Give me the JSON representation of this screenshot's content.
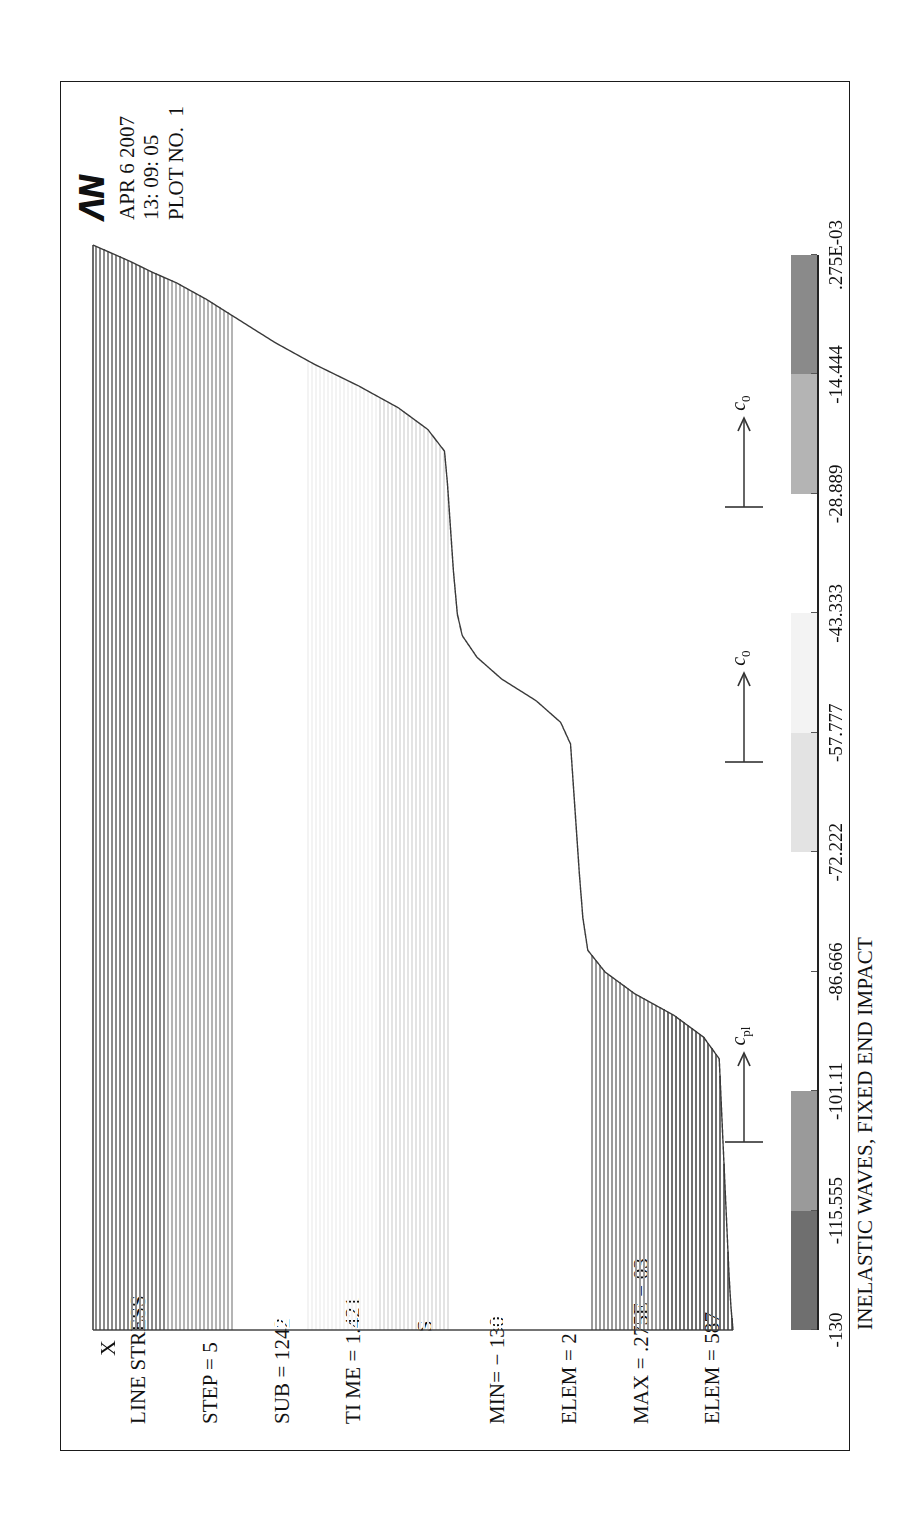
{
  "window": {
    "background": "#ffffff",
    "frame_color": "#1a1a1a"
  },
  "header": {
    "logo_text": "ΛΝ",
    "logo_name": "ansys-logo",
    "date": "APR 6 2007",
    "time": "13: 09: 05",
    "plot_no": "PLOT NO.  1"
  },
  "info": {
    "line1": "LINE STRESS",
    "line2": "STEP = 5",
    "line3": "SUB = 1242",
    "line4": "TI ME = 1.421",
    "line5": "S",
    "line6": "MIN= − 130",
    "line7": "ELEM = 2",
    "line8": "MAX = .275E − 03",
    "line9": "ELEM = 587"
  },
  "plot": {
    "x_axis_label": "X",
    "title": "INELASTIC WAVES, FIXED END IMPACT",
    "annotations": [
      {
        "name": "c-pl-arrow",
        "label": "c",
        "subscript": "pl"
      },
      {
        "name": "c-0-arrow-left",
        "label": "c",
        "subscript": "0"
      },
      {
        "name": "c-0-arrow-right",
        "label": "c",
        "subscript": "0"
      }
    ]
  },
  "colorbar": {
    "name": "stress-colorbar",
    "orientation": "horizontal",
    "labels": [
      "-130",
      "-115.555",
      "-101.11",
      "-86.666",
      "-72.222",
      "-57.777",
      "-43.333",
      "-28.889",
      "-14.444",
      ".275E-03"
    ],
    "band_colors": [
      "#6f6f6f",
      "#9a9a9a",
      "#ffffff",
      "#ffffff",
      "#e3e3e3",
      "#f3f3f3",
      "#ffffff",
      "#b4b4b4",
      "#8a8a8a"
    ]
  },
  "chart_data": {
    "type": "area",
    "title": "INELASTIC WAVES, FIXED END IMPACT",
    "subtitle": "LINE STRESS",
    "xlabel": "X",
    "ylabel": "S (stress)",
    "ylim": [
      -130,
      0.000275
    ],
    "result_min": -130,
    "result_min_elem": 2,
    "result_max": 0.000275,
    "result_max_elem": 587,
    "load_step": 5,
    "substep": 1242,
    "time": 1.421,
    "colorbar_levels": [
      -130,
      -115.555,
      -101.11,
      -86.666,
      -72.222,
      -57.777,
      -43.333,
      -28.889,
      -14.444,
      0.000275
    ],
    "x": [
      0,
      0.02,
      0.05,
      0.09,
      0.13,
      0.17,
      0.21,
      0.25,
      0.27,
      0.29,
      0.31,
      0.33,
      0.35,
      0.38,
      0.42,
      0.46,
      0.5,
      0.54,
      0.56,
      0.58,
      0.6,
      0.62,
      0.64,
      0.66,
      0.7,
      0.74,
      0.78,
      0.81,
      0.83,
      0.85,
      0.87,
      0.89,
      0.91,
      0.93,
      0.95,
      0.965,
      0.975,
      0.985,
      0.992,
      0.997,
      1.0
    ],
    "values": [
      -130,
      -129.6,
      -129.2,
      -128.8,
      -128.4,
      -128.0,
      -127.6,
      -127.2,
      -124.0,
      -118.0,
      -110.0,
      -104.0,
      -100.5,
      -99.5,
      -98.8,
      -98.2,
      -97.6,
      -97.0,
      -95.0,
      -90.0,
      -83.0,
      -78.0,
      -75.0,
      -74.0,
      -73.2,
      -72.6,
      -72.0,
      -71.4,
      -68.0,
      -62.0,
      -54.0,
      -45.0,
      -37.0,
      -30.0,
      -23.0,
      -17.0,
      -12.0,
      -7.5,
      -4.0,
      -1.5,
      0.0
    ],
    "grid": false,
    "legend": "colorbar-below"
  }
}
